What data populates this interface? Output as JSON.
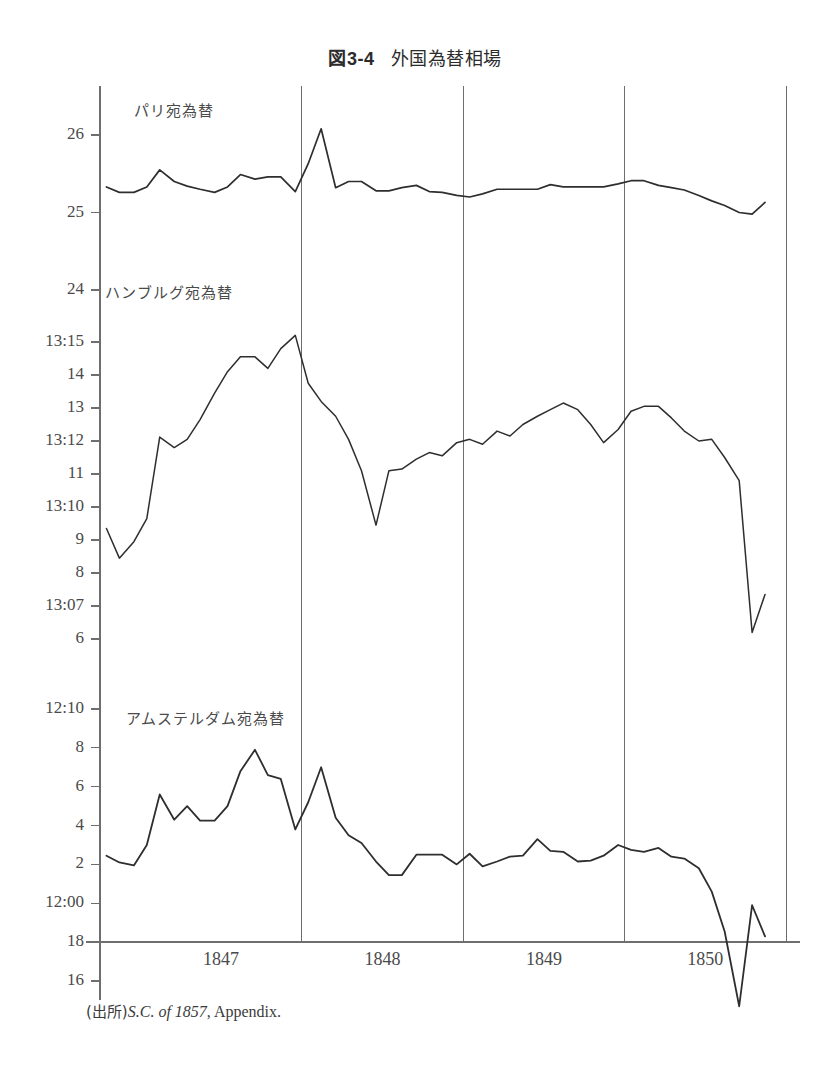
{
  "figure": {
    "number": "図3-4",
    "title": "外国為替相場",
    "source_prefix": "(出所)",
    "source_italic": "S.C. of 1857",
    "source_rest": ", Appendix."
  },
  "chart_data": {
    "type": "line",
    "xlabel": "",
    "ylabel": "",
    "grid": true,
    "legend_position": "inline-panel-labels",
    "xlim": [
      1846.75,
      1851.0
    ],
    "x_tick_labels": [
      "1847",
      "1848",
      "1849",
      "1850"
    ],
    "x_tick_values": [
      1847.5,
      1848.5,
      1849.5,
      1850.5
    ],
    "gridlines_x": [
      1848.0,
      1849.0,
      1850.0,
      1851.0
    ],
    "panels": [
      {
        "name": "paris",
        "label": "パリ宛為替",
        "ylim": [
          24.0,
          26.45
        ],
        "y_tick_values": [
          26,
          25,
          24
        ],
        "y_tick_labels": [
          "26",
          "25",
          "24"
        ],
        "unit": "francs per pound sterling",
        "series": [
          {
            "name": "パリ宛為替",
            "x": [
              1846.79,
              1846.87,
              1846.96,
              1847.04,
              1847.12,
              1847.21,
              1847.29,
              1847.37,
              1847.46,
              1847.54,
              1847.62,
              1847.71,
              1847.79,
              1847.87,
              1847.96,
              1848.04,
              1848.12,
              1848.21,
              1848.29,
              1848.37,
              1848.46,
              1848.54,
              1848.62,
              1848.71,
              1848.79,
              1848.87,
              1848.96,
              1849.04,
              1849.12,
              1849.21,
              1849.29,
              1849.37,
              1849.46,
              1849.54,
              1849.62,
              1849.71,
              1849.79,
              1849.87,
              1849.96,
              1850.04,
              1850.12,
              1850.21,
              1850.29,
              1850.37,
              1850.46,
              1850.54,
              1850.62,
              1850.71,
              1850.79,
              1850.87
            ],
            "y": [
              25.33,
              25.26,
              25.26,
              25.33,
              25.55,
              25.4,
              25.34,
              25.3,
              25.26,
              25.33,
              25.49,
              25.43,
              25.46,
              25.46,
              25.27,
              25.63,
              26.08,
              25.32,
              25.4,
              25.4,
              25.28,
              25.28,
              25.32,
              25.35,
              25.27,
              25.26,
              25.22,
              25.2,
              25.24,
              25.3,
              25.3,
              25.3,
              25.3,
              25.36,
              25.33,
              25.33,
              25.33,
              25.33,
              25.37,
              25.41,
              25.41,
              25.35,
              25.32,
              25.29,
              25.22,
              25.15,
              25.09,
              25.0,
              24.98,
              25.13
            ]
          }
        ]
      },
      {
        "name": "hamburg",
        "label": "ハンブルグ宛為替",
        "ylim": [
          13.055,
          13.165
        ],
        "y_tick_values": [
          13.15,
          13.14,
          13.13,
          13.12,
          13.11,
          13.1,
          13.09,
          13.08,
          13.07,
          13.06
        ],
        "y_tick_labels": [
          "13:15",
          "14",
          "13",
          "13:12",
          "11",
          "13:10",
          "9",
          "8",
          "13:07",
          "6"
        ],
        "unit": "schillings per pound sterling",
        "series": [
          {
            "name": "ハンブルグ宛為替",
            "x": [
              1846.79,
              1846.87,
              1846.96,
              1847.04,
              1847.12,
              1847.21,
              1847.29,
              1847.37,
              1847.46,
              1847.54,
              1847.62,
              1847.71,
              1847.79,
              1847.87,
              1847.96,
              1848.04,
              1848.12,
              1848.21,
              1848.29,
              1848.37,
              1848.46,
              1848.54,
              1848.62,
              1848.71,
              1848.79,
              1848.87,
              1848.96,
              1849.04,
              1849.12,
              1849.21,
              1849.29,
              1849.37,
              1849.46,
              1849.54,
              1849.62,
              1849.71,
              1849.79,
              1849.87,
              1849.96,
              1850.04,
              1850.12,
              1850.21,
              1850.29,
              1850.37,
              1850.46,
              1850.54,
              1850.62,
              1850.71,
              1850.79,
              1850.87
            ],
            "y": [
              13.0935,
              13.0845,
              13.0895,
              13.0965,
              13.1212,
              13.118,
              13.1205,
              13.1265,
              13.1345,
              13.141,
              13.1455,
              13.1455,
              13.142,
              13.148,
              13.152,
              13.1375,
              13.132,
              13.1275,
              13.1205,
              13.111,
              13.0945,
              13.111,
              13.1115,
              13.1145,
              13.1165,
              13.1155,
              13.1195,
              13.1205,
              13.119,
              13.123,
              13.1215,
              13.125,
              13.1275,
              13.1295,
              13.1315,
              13.1295,
              13.125,
              13.1195,
              13.1235,
              13.129,
              13.1305,
              13.1305,
              13.127,
              13.123,
              13.12,
              13.1205,
              13.115,
              13.108,
              13.062,
              13.0735
            ]
          }
        ]
      },
      {
        "name": "amsterdam",
        "label": "アムステルダム宛為替",
        "ylim": [
          11.955,
          12.105
        ],
        "y_tick_values": [
          12.1,
          12.08,
          12.06,
          12.04,
          12.02,
          12.0,
          11.98,
          11.96
        ],
        "y_tick_labels": [
          "12:10",
          "8",
          "6",
          "4",
          "2",
          "12:00",
          "18",
          "16"
        ],
        "unit": "florins per pound sterling",
        "series": [
          {
            "name": "アムステルダム宛為替",
            "x": [
              1846.79,
              1846.87,
              1846.96,
              1847.04,
              1847.12,
              1847.21,
              1847.29,
              1847.37,
              1847.46,
              1847.54,
              1847.62,
              1847.71,
              1847.79,
              1847.87,
              1847.96,
              1848.04,
              1848.12,
              1848.21,
              1848.29,
              1848.37,
              1848.46,
              1848.54,
              1848.62,
              1848.71,
              1848.79,
              1848.87,
              1848.96,
              1849.04,
              1849.12,
              1849.21,
              1849.29,
              1849.37,
              1849.46,
              1849.54,
              1849.62,
              1849.71,
              1849.79,
              1849.87,
              1849.96,
              1850.04,
              1850.12,
              1850.21,
              1850.29,
              1850.37,
              1850.46,
              1850.54,
              1850.62,
              1850.71,
              1850.79,
              1850.87
            ],
            "y": [
              12.0245,
              12.021,
              12.0195,
              12.03,
              12.056,
              12.043,
              12.05,
              12.0425,
              12.0425,
              12.05,
              12.068,
              12.079,
              12.066,
              12.064,
              12.038,
              12.052,
              12.07,
              12.044,
              12.035,
              12.031,
              12.0215,
              12.0145,
              12.0145,
              12.025,
              12.025,
              12.025,
              12.02,
              12.0255,
              12.019,
              12.0215,
              12.024,
              12.0245,
              12.033,
              12.027,
              12.0265,
              12.0215,
              12.022,
              12.0245,
              12.03,
              12.0275,
              12.0265,
              12.0285,
              12.024,
              12.023,
              12.018,
              12.006,
              11.9855,
              11.947,
              11.999,
              11.983
            ]
          }
        ]
      }
    ]
  }
}
